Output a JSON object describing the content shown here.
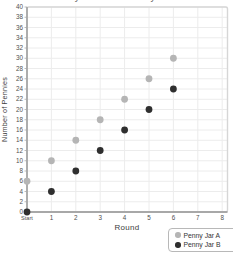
{
  "chart_data": {
    "type": "scatter",
    "title_cropped": "Penny Jar A and Penny Jar B",
    "xlabel": "Round",
    "ylabel": "Number of Pennies",
    "x_categories": [
      "Start",
      "1",
      "2",
      "3",
      "4",
      "5",
      "6",
      "7",
      "8"
    ],
    "ylim": [
      0,
      40
    ],
    "y_tick_step": 2,
    "grid": true,
    "legend_position": "bottom-right",
    "series": [
      {
        "name": "Penny Jar A",
        "color": "#b5b5b5",
        "x": [
          0,
          1,
          2,
          3,
          4,
          5,
          6
        ],
        "values": [
          6,
          10,
          14,
          18,
          22,
          26,
          30
        ]
      },
      {
        "name": "Penny Jar B",
        "color": "#2f2f2f",
        "x": [
          0,
          1,
          2,
          3,
          4,
          5,
          6
        ],
        "values": [
          0,
          4,
          8,
          12,
          16,
          20,
          24
        ]
      }
    ]
  },
  "colors": {
    "grid": "#ececec",
    "plot_border": "#d6d6d6",
    "axis": "#a8a8a8",
    "tick_text": "#4f4f4f",
    "legend_border": "#b8b8b8"
  }
}
